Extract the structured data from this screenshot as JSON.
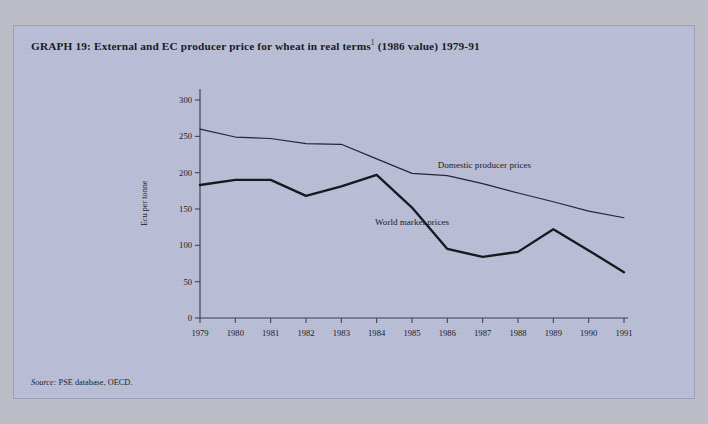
{
  "figure": {
    "title_prefix": "GRAPH 19:",
    "title_main": "External and EC producer price for wheat in real terms",
    "title_footnote_marker": "1",
    "title_suffix": "(1986 value) 1979-91",
    "source_label": "Source:",
    "source_text": "PSE database, OECD.",
    "background_color": "#b9bed6",
    "page_color": "#bdbdc8",
    "ink_color": "#16161c"
  },
  "chart_data": {
    "type": "line",
    "xlabel": "",
    "ylabel": "Ecu per tonne",
    "x": [
      1979,
      1980,
      1981,
      1982,
      1983,
      1984,
      1985,
      1986,
      1987,
      1988,
      1989,
      1990,
      1991
    ],
    "categories": [
      "1979",
      "1980",
      "1981",
      "1982",
      "1983",
      "1984",
      "1985",
      "1986",
      "1987",
      "1988",
      "1989",
      "1990",
      "1991"
    ],
    "ylim": [
      0,
      300
    ],
    "yticks": [
      0,
      50,
      100,
      150,
      200,
      250,
      300
    ],
    "ytick_labels": [
      "0",
      "50",
      "100",
      "150",
      "200",
      "250",
      "300"
    ],
    "grid": false,
    "legend": "inline-annotations",
    "series": [
      {
        "name": "Domestic producer prices",
        "style": "thin",
        "color": "#22222e",
        "values": [
          260,
          249,
          247,
          240,
          239,
          219,
          199,
          196,
          185,
          172,
          160,
          147,
          138
        ]
      },
      {
        "name": "World market prices",
        "style": "thick",
        "color": "#14141c",
        "values": [
          183,
          190,
          190,
          168,
          181,
          197,
          152,
          95,
          84,
          91,
          122,
          93,
          63
        ]
      }
    ],
    "annotations": [
      {
        "text": "Domestic producer prices",
        "x": 1987.05,
        "y": 206
      },
      {
        "text": "World market prices",
        "x": 1985.0,
        "y": 128
      }
    ]
  }
}
